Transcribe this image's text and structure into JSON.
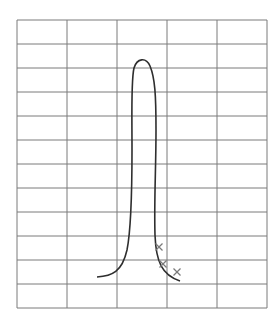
{
  "grid": {
    "left": 17,
    "top": 20,
    "right": 267,
    "bottom": 308,
    "cols": 5,
    "rows": 12,
    "color": "#7a7a7a"
  },
  "curve": {
    "color": "#2e2e2e",
    "path": "M97,277 C112,276 122,272 127,250 C131,230 132,200 132,150 C132,110 131,80 134,68 C137,58 146,57 150,66 C155,78 156,95 156,130 C156,170 154,200 155,235 C156,262 162,275 180,281"
  },
  "markers": {
    "color": "#7a7a7a",
    "symbol": "cross",
    "points": [
      {
        "x": 159,
        "y": 247
      },
      {
        "x": 163,
        "y": 264
      },
      {
        "x": 177,
        "y": 272
      }
    ]
  }
}
